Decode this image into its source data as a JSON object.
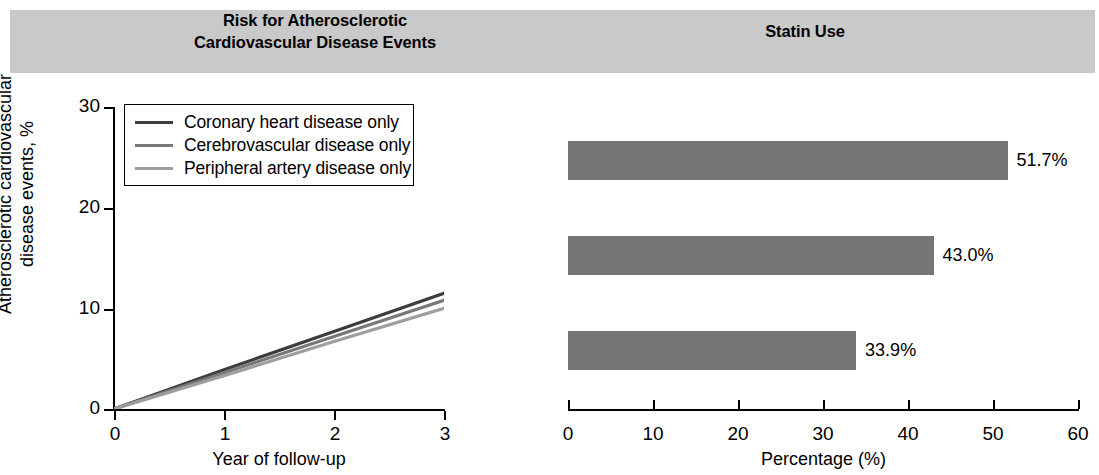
{
  "figure": {
    "panels": [
      {
        "id": "risk",
        "title": "Risk for Atherosclerotic\nCardiovascular Disease Events"
      },
      {
        "id": "statin",
        "title": "Statin Use"
      }
    ],
    "header_band_color": "#c9c9c9"
  },
  "left": {
    "title_line1": "Risk for Atherosclerotic",
    "title_line2": "Cardiovascular Disease Events",
    "y_label_line1": "Atherosclerotic cardiovascular",
    "y_label_line2": "disease events, %",
    "x_label": "Year of follow-up",
    "y_ticks": [
      "30",
      "20",
      "10",
      "0"
    ],
    "x_ticks": [
      "0",
      "1",
      "2",
      "3"
    ],
    "legend": [
      {
        "label": "Coronary heart disease only",
        "color": "#3d3d3d"
      },
      {
        "label": "Cerebrovascular disease only",
        "color": "#787878"
      },
      {
        "label": "Peripheral artery disease only",
        "color": "#9e9e9e"
      }
    ]
  },
  "right": {
    "title": "Statin Use",
    "x_label": "Percentage (%)",
    "x_ticks": [
      "0",
      "10",
      "20",
      "30",
      "40",
      "50",
      "60"
    ],
    "bars": [
      {
        "label": "51.7%",
        "value": 51.7
      },
      {
        "label": "43.0%",
        "value": 43.0
      },
      {
        "label": "33.9%",
        "value": 33.9
      }
    ],
    "bar_color": "#757575"
  },
  "chart_data": [
    {
      "type": "line",
      "title": "Risk for Atherosclerotic Cardiovascular Disease Events",
      "xlabel": "Year of follow-up",
      "ylabel": "Atherosclerotic cardiovascular disease events, %",
      "xlim": [
        0,
        3
      ],
      "ylim": [
        0,
        30
      ],
      "xticks": [
        0,
        1,
        2,
        3
      ],
      "yticks": [
        0,
        10,
        20,
        30
      ],
      "grid": false,
      "legend_position": "upper-left",
      "x": [
        0,
        1,
        2,
        3
      ],
      "series": [
        {
          "name": "Coronary heart disease only",
          "color": "#3d3d3d",
          "values": [
            0,
            3.9,
            7.7,
            11.5
          ]
        },
        {
          "name": "Cerebrovascular disease only",
          "color": "#787878",
          "values": [
            0,
            3.6,
            7.2,
            10.8
          ]
        },
        {
          "name": "Peripheral artery disease only",
          "color": "#9e9e9e",
          "values": [
            0,
            3.3,
            6.7,
            10.0
          ]
        }
      ]
    },
    {
      "type": "bar",
      "orientation": "horizontal",
      "title": "Statin Use",
      "xlabel": "Percentage (%)",
      "ylabel": "",
      "xlim": [
        0,
        60
      ],
      "xticks": [
        0,
        10,
        20,
        30,
        40,
        50,
        60
      ],
      "grid": false,
      "categories": [
        "Coronary heart disease only",
        "Cerebrovascular disease only",
        "Peripheral artery disease only"
      ],
      "values": [
        51.7,
        43.0,
        33.9
      ],
      "data_labels": [
        "51.7%",
        "43.0%",
        "33.9%"
      ],
      "bar_color": "#757575"
    }
  ]
}
